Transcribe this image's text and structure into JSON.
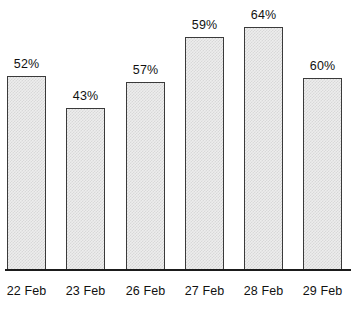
{
  "chart_data": {
    "type": "bar",
    "title": "",
    "subtitle": "",
    "xlabel": "",
    "ylabel": "",
    "categories": [
      "22 Feb",
      "23 Feb",
      "26 Feb",
      "27 Feb",
      "28 Feb",
      "29 Feb"
    ],
    "values": [
      52,
      43,
      57,
      59,
      64,
      60
    ],
    "value_labels": [
      "52%",
      "43%",
      "57%",
      "59%",
      "64%",
      "60%"
    ],
    "value_unit": "%",
    "grid": false,
    "legend": false,
    "legend_position": "none",
    "axis": {
      "y_visible": false,
      "y_ticks": [],
      "x_visible": true,
      "x_tick_labels": [
        "22 Feb",
        "23 Feb",
        "26 Feb",
        "27 Feb",
        "28 Feb",
        "29 Feb"
      ]
    },
    "bars": [
      {
        "label": "22 Feb",
        "value": 52,
        "value_label": "52%",
        "x": 7,
        "width": 39,
        "top": 76,
        "height": 194
      },
      {
        "label": "23 Feb",
        "value": 43,
        "value_label": "43%",
        "x": 66,
        "width": 39,
        "top": 108,
        "height": 162
      },
      {
        "label": "26 Feb",
        "value": 57,
        "value_label": "57%",
        "x": 126,
        "width": 39,
        "top": 82,
        "height": 188
      },
      {
        "label": "27 Feb",
        "value": 59,
        "value_label": "59%",
        "x": 185,
        "width": 39,
        "top": 37,
        "height": 233
      },
      {
        "label": "28 Feb",
        "value": 64,
        "value_label": "64%",
        "x": 244,
        "width": 39,
        "top": 27,
        "height": 243
      },
      {
        "label": "29 Feb",
        "value": 60,
        "value_label": "60%",
        "x": 303,
        "width": 39,
        "top": 78,
        "height": 192
      }
    ],
    "colors": {
      "bar_fill": "#ededed",
      "bar_pattern": "#d8d8d8",
      "bar_border": "#3a3a3a",
      "axis": "#1b1b1b",
      "text": "#111111",
      "background": "#ffffff"
    }
  }
}
